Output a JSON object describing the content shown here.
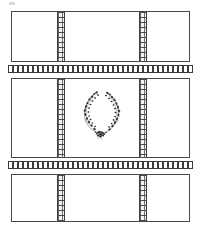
{
  "figure": {
    "width": 201,
    "height": 231,
    "background_color": "#ffffff",
    "line_color": "#4a4a4a",
    "ink_color": "#2b2b2b"
  },
  "artifact": {
    "label": "faint smudge mark",
    "color": "#b9b9b9"
  },
  "panels": [
    {
      "name": "top-panel",
      "label": "Top panel",
      "x": 11,
      "y": 11,
      "width": 179,
      "height": 51,
      "has_motif": false,
      "motif": ""
    },
    {
      "name": "middle-panel",
      "label": "Middle panel",
      "x": 11,
      "y": 78,
      "width": 179,
      "height": 80,
      "has_motif": true,
      "motif": "floral-wreath"
    },
    {
      "name": "bottom-panel",
      "label": "Bottom panel",
      "x": 11,
      "y": 174,
      "width": 179,
      "height": 48,
      "has_motif": false,
      "motif": ""
    }
  ],
  "vertical_bands": [
    {
      "name": "vband-top-left",
      "label": "Left patterned stripe, top panel",
      "panel": "top-panel",
      "x": 57,
      "y": 12,
      "width": 8,
      "height": 49,
      "pattern": "brick-checker"
    },
    {
      "name": "vband-top-right",
      "label": "Right patterned stripe, top panel",
      "panel": "top-panel",
      "x": 139,
      "y": 12,
      "width": 8,
      "height": 49,
      "pattern": "brick-checker"
    },
    {
      "name": "vband-middle-left",
      "label": "Left patterned stripe, middle panel",
      "panel": "middle-panel",
      "x": 57,
      "y": 79,
      "width": 8,
      "height": 78,
      "pattern": "brick-checker"
    },
    {
      "name": "vband-middle-right",
      "label": "Right patterned stripe, middle panel",
      "panel": "middle-panel",
      "x": 139,
      "y": 79,
      "width": 8,
      "height": 78,
      "pattern": "brick-checker"
    },
    {
      "name": "vband-bottom-left",
      "label": "Left patterned stripe, bottom panel",
      "panel": "bottom-panel",
      "x": 57,
      "y": 175,
      "width": 8,
      "height": 46,
      "pattern": "brick-checker"
    },
    {
      "name": "vband-bottom-right",
      "label": "Right patterned stripe, bottom panel",
      "panel": "bottom-panel",
      "x": 139,
      "y": 175,
      "width": 8,
      "height": 46,
      "pattern": "brick-checker"
    }
  ],
  "horizontal_bands": [
    {
      "name": "hband-upper",
      "label": "Upper horizontal patterned border",
      "x": 8,
      "y": 65,
      "width": 185,
      "height": 8,
      "pattern": "dashed-blocks"
    },
    {
      "name": "hband-lower",
      "label": "Lower horizontal patterned border",
      "x": 8,
      "y": 161,
      "width": 185,
      "height": 8,
      "pattern": "dashed-blocks"
    }
  ],
  "wreath": {
    "name": "floral-wreath-motif",
    "label": "Floral wreath motif",
    "description": "Two symmetric leafy sprays forming an open laurel wreath ring",
    "x": 74,
    "y": 86,
    "width": 54,
    "height": 54,
    "ink_color": "#2b2b2b"
  }
}
